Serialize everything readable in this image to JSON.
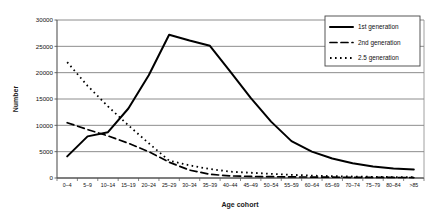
{
  "chart_data": {
    "type": "line",
    "title": "",
    "xlabel": "Age cohort",
    "ylabel": "Number",
    "ylim": [
      0,
      30000
    ],
    "ytick_values": [
      0,
      5000,
      10000,
      15000,
      20000,
      25000,
      30000
    ],
    "ytick_labels": [
      "0",
      "5000",
      "10000",
      "15000",
      "20000",
      "25000",
      "30000"
    ],
    "grid": "horizontal",
    "legend_position": "top-right",
    "categories": [
      "0–4",
      "5–9",
      "10–14",
      "15–19",
      "20–24",
      "25–29",
      "30–34",
      "35–39",
      "40–44",
      "45–49",
      "50–54",
      "55–59",
      "60–64",
      "65–69",
      "70–74",
      "75–79",
      "80–84",
      ">85"
    ],
    "series": [
      {
        "name": "1st generation",
        "style": "solid",
        "color": "#000000",
        "values": [
          4100,
          7900,
          8700,
          13200,
          19500,
          27200,
          26100,
          25100,
          20200,
          15200,
          10700,
          7000,
          5000,
          3700,
          2800,
          2200,
          1800,
          1600
        ]
      },
      {
        "name": "2nd generation",
        "style": "dashed",
        "color": "#000000",
        "values": [
          10500,
          9200,
          8000,
          6600,
          5000,
          3000,
          1500,
          700,
          400,
          300,
          250,
          200,
          180,
          150,
          130,
          110,
          100,
          90
        ]
      },
      {
        "name": "2.5 generation",
        "style": "dotted",
        "color": "#000000",
        "values": [
          22000,
          17500,
          13600,
          10000,
          6600,
          3300,
          2400,
          1700,
          1200,
          1000,
          800,
          600,
          450,
          350,
          280,
          220,
          180,
          150
        ]
      }
    ]
  },
  "legend": {
    "items": [
      {
        "label": "1st generation",
        "style": "solid"
      },
      {
        "label": "2nd generation",
        "style": "dashed"
      },
      {
        "label": "2.5 generation",
        "style": "dotted"
      }
    ]
  }
}
